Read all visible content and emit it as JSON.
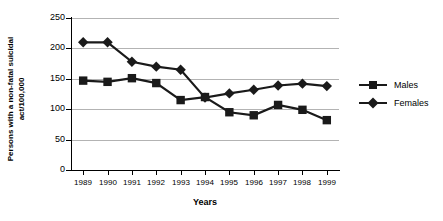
{
  "chart_data": {
    "type": "line",
    "title": "",
    "xlabel": "Years",
    "ylabel": "Persons with a non-fatal suicidal act/100,000",
    "ylabel_line1": "Persons with a non-fatal suicidal",
    "ylabel_line2": "act/100,000",
    "categories": [
      "1989",
      "1990",
      "1991",
      "1992",
      "1993",
      "1994",
      "1995",
      "1996",
      "1997",
      "1998",
      "1999"
    ],
    "x": [
      1989,
      1990,
      1991,
      1992,
      1993,
      1994,
      1995,
      1996,
      1997,
      1998,
      1999
    ],
    "ylim": [
      0,
      250
    ],
    "yticks": [
      0,
      50,
      100,
      150,
      200,
      250
    ],
    "ytick_labels": [
      "0",
      "50",
      "100",
      "150",
      "200",
      "250"
    ],
    "grid": true,
    "grid_axis": "y",
    "legend_position": "right",
    "series": [
      {
        "name": "Males",
        "marker": "square",
        "color": "#1a1a1a",
        "values": [
          147,
          145,
          151,
          143,
          115,
          120,
          95,
          90,
          107,
          99,
          82
        ]
      },
      {
        "name": "Females",
        "marker": "diamond",
        "color": "#1a1a1a",
        "values": [
          210,
          210,
          178,
          170,
          165,
          119,
          126,
          132,
          139,
          142,
          138
        ]
      }
    ]
  },
  "legend": {
    "entries": [
      {
        "label": "Males",
        "marker": "square-marker-icon"
      },
      {
        "label": "Females",
        "marker": "diamond-marker-icon"
      }
    ]
  },
  "colors": {
    "series": "#1a1a1a",
    "gridline": "#b3b3b3",
    "axis": "#000000",
    "background": "#ffffff"
  }
}
